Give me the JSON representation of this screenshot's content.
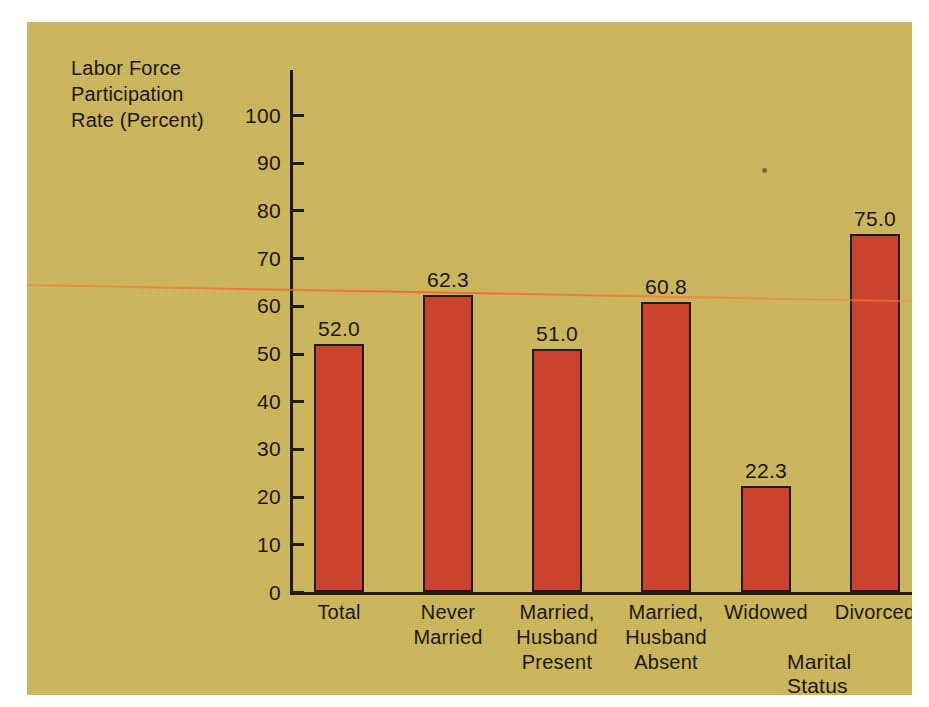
{
  "chart_data": {
    "type": "bar",
    "title": "",
    "categories": [
      "Total",
      "Never\nMarried",
      "Married,\nHusband\nPresent",
      "Married,\nHusband\nAbsent",
      "Widowed",
      "Divorced"
    ],
    "values": [
      52.0,
      62.3,
      51.0,
      60.8,
      22.3,
      75.0
    ],
    "value_labels": [
      "52.0",
      "62.3",
      "51.0",
      "60.8",
      "22.3",
      "75.0"
    ],
    "xlabel": "Marital Status",
    "ylabel": "Labor Force\nParticipation\nRate (Percent)",
    "ylim": [
      0,
      100
    ],
    "ytick_labels": [
      "100",
      "90",
      "80",
      "70",
      "60",
      "50",
      "40",
      "30",
      "20",
      "10",
      "0"
    ],
    "ytick_values": [
      100,
      90,
      80,
      70,
      60,
      50,
      40,
      30,
      20,
      10,
      0
    ],
    "grid": false,
    "legend": null,
    "colors": {
      "background": "#cdb75c",
      "page": "#ffffff",
      "bar_fill": "#c9432f",
      "bar_outline": "#23190b",
      "axis": "#201a0c",
      "text": "#1d1709",
      "scanline": "#ff5a28"
    }
  }
}
